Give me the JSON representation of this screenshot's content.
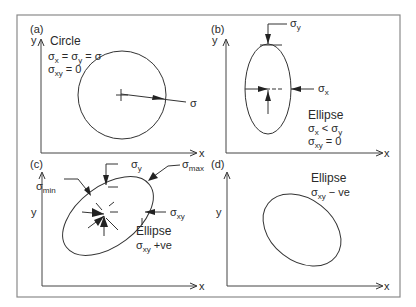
{
  "figure": {
    "panels": [
      {
        "id": "a",
        "label": "(a)",
        "axis_y": "y",
        "axis_x": "x",
        "shape": "Circle",
        "conditions": [
          "σx = σy = σ",
          "σxy = 0"
        ],
        "cond1": {
          "s1": "σ",
          "sub1": "x",
          "eq1": " = ",
          "s2": "σ",
          "sub2": "y",
          "rest": " = σ"
        },
        "cond2": {
          "s": "σ",
          "sub": "xy",
          "rest": " = 0"
        },
        "arrow_label": "σ"
      },
      {
        "id": "b",
        "label": "(b)",
        "axis_y": "y",
        "axis_x": "x",
        "shape": "Ellipse",
        "conditions": [
          "σx < σy",
          "σxy = 0"
        ],
        "sigma_y": {
          "s": "σ",
          "sub": "y"
        },
        "sigma_x": {
          "s": "σ",
          "sub": "x"
        },
        "cond1": {
          "s1": "σ",
          "sub1": "x",
          "op": " < ",
          "s2": "σ",
          "sub2": "y"
        },
        "cond2": {
          "s": "σ",
          "sub": "xy",
          "rest": " = 0"
        }
      },
      {
        "id": "c",
        "label": "(c)",
        "axis_y": "y",
        "axis_x": "x",
        "shape": "Ellipse",
        "conditions": [
          "σxy +ve"
        ],
        "sigma_y": {
          "s": "σ",
          "sub": "y"
        },
        "sigma_max": {
          "s": "σ",
          "sub": "max"
        },
        "sigma_min": {
          "s": "σ",
          "sub": "min"
        },
        "sigma_xy": {
          "s": "σ",
          "sub": "xy"
        },
        "cond1": {
          "s": "σ",
          "sub": "xy",
          "rest": " +ve"
        }
      },
      {
        "id": "d",
        "label": "(d)",
        "axis_y": "y",
        "axis_x": "x",
        "shape": "Ellipse",
        "conditions": [
          "σxy − ve"
        ],
        "cond1": {
          "s": "σ",
          "sub": "xy",
          "rest": " − ve"
        }
      }
    ]
  }
}
